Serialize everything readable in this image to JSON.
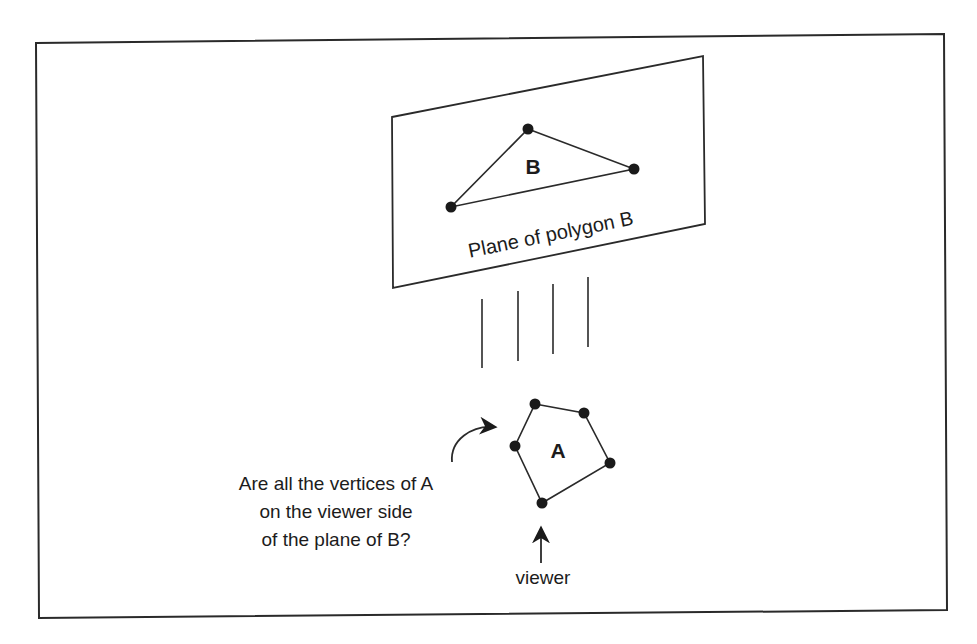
{
  "diagram": {
    "frame": {
      "points": [
        [
          36,
          43
        ],
        [
          944,
          34
        ],
        [
          947,
          610
        ],
        [
          39,
          618
        ]
      ],
      "stroke": "#2a2a2a"
    },
    "plane_b": {
      "label": "Plane of polygon B",
      "points": [
        [
          392,
          117
        ],
        [
          703,
          56
        ],
        [
          705,
          224
        ],
        [
          393,
          288
        ]
      ],
      "label_pos": [
        552,
        241
      ],
      "label_rotation": -11.5
    },
    "polygon_b": {
      "label": "B",
      "label_pos": [
        533,
        174
      ],
      "vertices": [
        [
          528,
          129
        ],
        [
          634,
          169
        ],
        [
          451,
          207
        ]
      ]
    },
    "projection_lines": [
      {
        "x": 482,
        "y1": 299,
        "y2": 368
      },
      {
        "x": 518,
        "y1": 291,
        "y2": 361
      },
      {
        "x": 553,
        "y1": 284,
        "y2": 354
      },
      {
        "x": 588,
        "y1": 277,
        "y2": 347
      }
    ],
    "polygon_a": {
      "label": "A",
      "label_pos": [
        558,
        458
      ],
      "vertices": [
        [
          535,
          404
        ],
        [
          584,
          413
        ],
        [
          610,
          463
        ],
        [
          542,
          503
        ],
        [
          515,
          446
        ]
      ]
    },
    "question": {
      "lines": [
        "Are all the vertices of A",
        "on the viewer side",
        "of the plane of B?"
      ],
      "center_x": 336,
      "line_y": [
        490,
        518,
        546
      ]
    },
    "question_arrow": {
      "from": [
        452,
        462
      ],
      "tip": [
        500,
        427
      ]
    },
    "viewer": {
      "label": "viewer",
      "label_pos": [
        543,
        584
      ],
      "arrow_tip": [
        541,
        523
      ],
      "arrow_base": [
        541,
        563
      ]
    }
  }
}
